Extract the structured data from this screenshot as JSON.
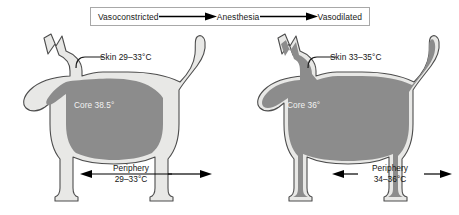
{
  "legend": {
    "start_label": "Vasoconstricted",
    "middle_label": "Anesthesia",
    "end_label": "Vasodilated",
    "arrow1_name": "rightward-arrow-icon",
    "arrow2_name": "rightward-arrow-icon"
  },
  "figures": {
    "left": {
      "state": "Vasoconstricted",
      "skin_label": "Skin 29–33°C",
      "core_label": "Core 38.5°",
      "periphery_label_line1": "Periphery",
      "periphery_label_line2": "29–33°C"
    },
    "right": {
      "state": "Vasodilated",
      "skin_label": "Skin 33–35°C",
      "core_label": "Core 36°",
      "periphery_label_line1": "Periphery",
      "periphery_label_line2": "34–36°C"
    }
  },
  "colors": {
    "core_fill": "#8c8c8c",
    "periphery_fill": "#e8e8e6",
    "outline": "#4d4d4d",
    "text": "#141414",
    "core_text": "#f2f2f2",
    "arrow": "#000000",
    "box_border": "#a8a8a8"
  }
}
